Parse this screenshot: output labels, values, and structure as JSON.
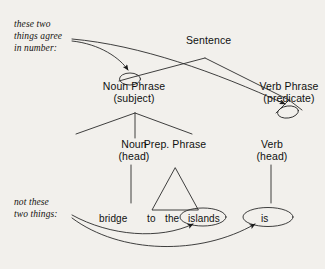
{
  "diagram": {
    "background_color": "#f2f0ec",
    "ink_color": "#1a1a1a",
    "annotations": [
      {
        "id": "agree",
        "lines": [
          "these two",
          "things agree",
          "in number:"
        ],
        "style": "italic"
      },
      {
        "id": "not-these",
        "lines": [
          "not these",
          "two things:"
        ],
        "style": "italic"
      }
    ],
    "nodes": {
      "sentence": {
        "label": "Sentence"
      },
      "noun_phrase": {
        "label": "Noun Phrase",
        "sublabel": "(subject)",
        "circled": true
      },
      "verb_phrase": {
        "label": "Verb Phrase",
        "sublabel": "(predicate)",
        "circled": true
      },
      "noun": {
        "label": "Noun",
        "sublabel": "(head)"
      },
      "prep_phrase": {
        "label": "Prep. Phrase",
        "sublabel": ""
      },
      "verb": {
        "label": "Verb",
        "sublabel": "(head)"
      }
    },
    "words": [
      {
        "id": "bridge",
        "text": "bridge",
        "circled": false
      },
      {
        "id": "to",
        "text": "to",
        "circled": false
      },
      {
        "id": "the",
        "text": "the",
        "circled": false
      },
      {
        "id": "islands",
        "text": "islands",
        "circled": true
      },
      {
        "id": "is",
        "text": "is",
        "circled": true
      }
    ],
    "arrows": [
      {
        "from": "agree-annotation",
        "to": "noun-phrase-node"
      },
      {
        "from": "agree-annotation",
        "to": "verb-phrase-node"
      },
      {
        "from": "not-these-annotation",
        "to": "islands-word"
      },
      {
        "from": "not-these-annotation",
        "to": "is-word"
      }
    ]
  }
}
